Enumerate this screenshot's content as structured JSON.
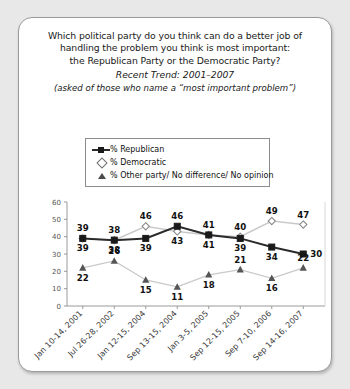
{
  "card": {
    "title_lines": [
      "Which political party do you think can do a better job of",
      "handling the problem you think is most important:",
      "the Republican Party or the Democratic Party?"
    ],
    "subtitle": "Recent Trend: 2001–2007",
    "note": "(asked of those who name a “most important problem”)"
  },
  "legend": {
    "items": [
      {
        "label": "% Republican",
        "marker": "filled-square",
        "color": "#1a1a1a"
      },
      {
        "label": "% Democratic",
        "marker": "open-diamond",
        "color": "#6e6e6e"
      },
      {
        "label": "% Other party/ No difference/ No opinion",
        "marker": "filled-triangle",
        "color": "#4a4a4a"
      }
    ]
  },
  "chart_data": {
    "type": "line",
    "title": "Which political party do you think can do a better job of handling the problem you think is most important: the Republican Party or the Democratic Party?",
    "subtitle": "Recent Trend: 2001–2007",
    "xlabel": "",
    "ylabel": "",
    "ylim": [
      0,
      60
    ],
    "yticks": [
      0,
      10,
      20,
      30,
      40,
      50,
      60
    ],
    "grid": false,
    "legend_position": "top-center",
    "categories": [
      "Jan 10-14, 2001",
      "Jul 26-28, 2002",
      "Jan 12-15, 2004",
      "Sep 13-15, 2004",
      "Jan 3-5, 2005",
      "Sep 12-15, 2005",
      "Sep 7-10, 2006",
      "Sep 14-16, 2007"
    ],
    "series": [
      {
        "name": "% Republican",
        "values": [
          39,
          38,
          39,
          46,
          41,
          39,
          34,
          30
        ]
      },
      {
        "name": "% Democratic",
        "values": [
          39,
          38,
          46,
          43,
          41,
          40,
          49,
          47
        ]
      },
      {
        "name": "% Other party/ No difference/ No opinion",
        "values": [
          22,
          26,
          15,
          11,
          18,
          21,
          16,
          22
        ]
      }
    ]
  }
}
